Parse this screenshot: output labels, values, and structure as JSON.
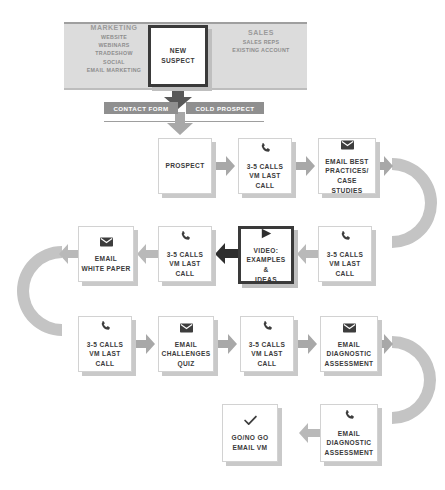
{
  "diagram": {
    "colors": {
      "banner_bg": "#dcdcdc",
      "pill_bg": "#8f8f8f",
      "arrow_dark": "#595959",
      "arrow_mid": "#a8a8a8",
      "arrow_light": "#b9b9b9",
      "box_border_strong": "#3a3a3a",
      "box_shadow": "#c9c9c9",
      "text": "#3a3a3a",
      "muted_text": "#8d8d8d"
    },
    "banner": {
      "channels": [
        {
          "heading": "MARKETING",
          "items": [
            "WEBSITE",
            "WEBINARS",
            "TRADESHOW",
            "SOCIAL",
            "EMAIL MARKETING"
          ]
        },
        {
          "heading": "SALES",
          "items": [
            "SALES REPS",
            "EXISTING ACCOUNT"
          ]
        }
      ],
      "entry_node": {
        "label": "NEW\nSUSPECT",
        "line1": "NEW",
        "line2": "SUSPECT"
      }
    },
    "pills": [
      {
        "label": "CONTACT FORM"
      },
      {
        "label": "COLD PROSPECT"
      }
    ],
    "rows": [
      {
        "row": 2,
        "direction": "left-to-right",
        "nodes": [
          {
            "icon": "none",
            "lines": [
              "PROSPECT"
            ]
          },
          {
            "icon": "phone-icon",
            "lines": [
              "3-5 CALLS",
              "VM LAST CALL"
            ]
          },
          {
            "icon": "envelope-icon",
            "lines": [
              "EMAIL BEST",
              "PRACTICES/",
              "CASE STUDIES"
            ]
          }
        ]
      },
      {
        "row": 3,
        "direction": "right-to-left",
        "nodes": [
          {
            "icon": "envelope-icon",
            "lines": [
              "EMAIL",
              "WHITE PAPER"
            ]
          },
          {
            "icon": "phone-icon",
            "lines": [
              "3-5 CALLS",
              "VM LAST CALL"
            ]
          },
          {
            "icon": "play-icon",
            "highlight": true,
            "lines": [
              "VIDEO:",
              "EXAMPLES &",
              "IDEAS"
            ]
          },
          {
            "icon": "phone-icon",
            "lines": [
              "3-5 CALLS",
              "VM LAST CALL"
            ]
          }
        ]
      },
      {
        "row": 4,
        "direction": "left-to-right",
        "nodes": [
          {
            "icon": "phone-icon",
            "lines": [
              "3-5 CALLS",
              "VM LAST CALL"
            ]
          },
          {
            "icon": "envelope-icon",
            "lines": [
              "EMAIL",
              "CHALLENGES",
              "QUIZ"
            ]
          },
          {
            "icon": "phone-icon",
            "lines": [
              "3-5 CALLS",
              "VM LAST CALL"
            ]
          },
          {
            "icon": "envelope-icon",
            "lines": [
              "EMAIL",
              "DIAGNOSTIC",
              "ASSESSMENT"
            ]
          }
        ]
      },
      {
        "row": 5,
        "direction": "right-to-left",
        "nodes": [
          {
            "icon": "check-icon",
            "lines": [
              "GO/NO GO",
              "EMAIL VM"
            ]
          },
          {
            "icon": "phone-icon",
            "lines": [
              "EMAIL",
              "DIAGNOSTIC",
              "ASSESSMENT"
            ]
          }
        ]
      }
    ]
  }
}
